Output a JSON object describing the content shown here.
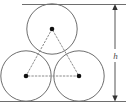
{
  "figure": {
    "kind": "geometry-diagram",
    "background_color": "#ffffff",
    "stroke_color": "#6e6e6e",
    "dash_color": "#8a8a8a",
    "dot_color": "#111111",
    "dimension_color": "#555555",
    "label_color": "#4a4a4a"
  },
  "labels": {
    "height": "h"
  },
  "circles": [
    {
      "name": "top-circle",
      "cx": 52,
      "cy": 29,
      "r": 25.5
    },
    {
      "name": "bottom-left-circle",
      "cx": 26,
      "cy": 76,
      "r": 25.5
    },
    {
      "name": "bottom-right-circle",
      "cx": 79,
      "cy": 76,
      "r": 25.5
    }
  ],
  "centers": [
    {
      "name": "top-center",
      "cx": 52,
      "cy": 29
    },
    {
      "name": "bottom-left-center",
      "cx": 26,
      "cy": 76
    },
    {
      "name": "bottom-right-center",
      "cx": 79,
      "cy": 76
    }
  ],
  "triangle": {
    "name": "center-triangle",
    "style": "dashed",
    "points": "52,29 26,76 79,76"
  },
  "tangent_lines": {
    "top": {
      "x1": 22,
      "y1": 4,
      "x2": 126,
      "y2": 4
    },
    "bottom": {
      "x1": 0,
      "y1": 101,
      "x2": 126,
      "y2": 101
    }
  },
  "dimension": {
    "name": "height-dimension",
    "x": 115,
    "y_top": 5,
    "y_bottom": 100,
    "label": "h",
    "label_x": 119,
    "label_y": 56,
    "arrowheads": [
      "up",
      "down"
    ]
  }
}
